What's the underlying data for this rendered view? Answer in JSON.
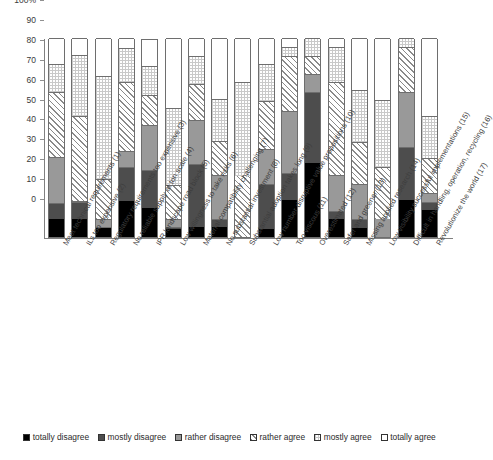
{
  "chart_data": {
    "type": "bar",
    "subtype": "stacked-percentage",
    "title": "",
    "xlabel": "",
    "ylabel": "",
    "ylim": [
      0,
      100
    ],
    "ytick_labels": [
      "100%",
      "90",
      "80",
      "70",
      "60",
      "50",
      "40",
      "30",
      "20",
      "10",
      "0"
    ],
    "ytick_values": [
      100,
      90,
      80,
      70,
      60,
      50,
      40,
      30,
      20,
      10,
      0
    ],
    "grid": false,
    "legend_position": "bottom",
    "stack_order_bottom_to_top": [
      "totally disagree",
      "mostly disagree",
      "rather disagree",
      "rather agree",
      "mostly agree",
      "totally agree"
    ],
    "series": [
      {
        "name": "totally disagree",
        "color": "#000000",
        "pattern": "solid-black",
        "values": [
          9,
          9,
          4.5,
          18,
          14.5,
          4,
          5,
          5,
          0,
          4,
          18.5,
          37,
          9,
          4.5,
          0,
          18.5,
          13.5
        ]
      },
      {
        "name": "mostly disagree",
        "color": "#4d4d4d",
        "pattern": "solid-dark-gray",
        "values": [
          8,
          8.5,
          0.5,
          17,
          19,
          1,
          31.5,
          4,
          0,
          22.5,
          13.5,
          36,
          4,
          4.5,
          0,
          26.5,
          4
        ]
      },
      {
        "name": "rather disagree",
        "color": "#999999",
        "pattern": "solid-mid-gray",
        "values": [
          23,
          0.5,
          4,
          8,
          23,
          4,
          22.5,
          22,
          0,
          17.5,
          31.5,
          9,
          18,
          17.5,
          9,
          28,
          4.5
        ]
      },
      {
        "name": "rather agree",
        "color": "#ffffff",
        "pattern": "diagonal-hatch",
        "values": [
          33,
          43,
          20,
          35,
          15,
          17,
          18,
          17,
          30.5,
          24.5,
          27.5,
          9,
          47,
          21,
          26,
          22.5,
          17.5
        ]
      },
      {
        "name": "mostly agree",
        "color": "#ffffff",
        "pattern": "cross-dot",
        "values": [
          14,
          30.5,
          52,
          17,
          14.5,
          39,
          14,
          21.5,
          47.5,
          18.5,
          4.5,
          9,
          17.5,
          26.5,
          34,
          4.5,
          21.5
        ]
      },
      {
        "name": "totally agree",
        "color": "#ffffff",
        "pattern": "white",
        "values": [
          13,
          8.5,
          19,
          5,
          13.5,
          35,
          9,
          30.5,
          22,
          13,
          4.5,
          0,
          4.5,
          26,
          31,
          0,
          39
        ]
      }
    ],
    "categories": [
      "Meet technical requirements (1)",
      "ILs too expensive (2)",
      "Regulatory requirements too expensive (3)",
      "No reliable supply at ton scale (4)",
      "IPR landscape road block (5)",
      "Low willingness to take risks (6)",
      "Material compatibility challenging (7)",
      "No substantial investment (8)",
      "Substantial adoption takes long (9)",
      "Low number disruptive value propositions (10)",
      "Too viscous (11)",
      "Overestimated (12)",
      "Safer and greener (13)",
      "Missing applied research (14)",
      "Low visibility successful implementations (15)",
      "Difficult in handling, operation, recycling (16)",
      "Revolutionize the world (17)"
    ]
  },
  "legend": {
    "items": [
      {
        "label": "totally disagree",
        "swatch": "solid-black"
      },
      {
        "label": "mostly disagree",
        "swatch": "solid-dark-gray"
      },
      {
        "label": "rather disagree",
        "swatch": "solid-mid-gray"
      },
      {
        "label": "rather agree",
        "swatch": "diagonal-hatch"
      },
      {
        "label": "mostly agree",
        "swatch": "cross-dot"
      },
      {
        "label": "totally agree",
        "swatch": "white"
      }
    ]
  }
}
